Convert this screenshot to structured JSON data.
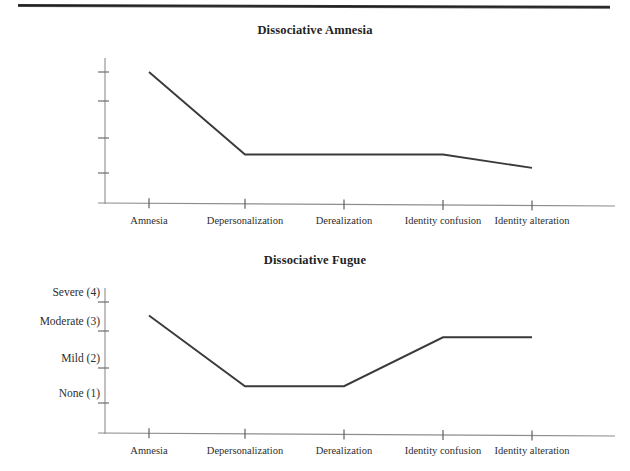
{
  "page": {
    "running_head": "",
    "background_color": "#ffffff",
    "ink_color": "#2b2b2b",
    "rule_color": "#1d1d1d"
  },
  "axis": {
    "y_tick_labels": [
      "Severe (4)",
      "Moderate (3)",
      "Mild (2)",
      "None (1)"
    ],
    "y_tick_values": [
      4,
      3,
      2,
      1
    ],
    "x_tick_labels": [
      "Amnesia",
      "Depersonalization",
      "Derealization",
      "Identity confusion",
      "Identity alteration"
    ]
  },
  "figures": [
    {
      "title": "Dissociative Amnesia"
    },
    {
      "title": "Dissociative Fugue"
    }
  ],
  "chart_data": [
    {
      "type": "line",
      "title": "Dissociative Amnesia",
      "xlabel": "",
      "ylabel": "",
      "categories": [
        "Amnesia",
        "Depersonalization",
        "Derealization",
        "Identity confusion",
        "Identity alteration"
      ],
      "values": [
        4.0,
        1.55,
        1.55,
        1.55,
        1.15
      ],
      "ylim": [
        0.7,
        4.35
      ],
      "ytick_values": [
        4,
        3,
        2,
        1
      ],
      "ytick_labels": [
        "Severe (4)",
        "Moderate (3)",
        "Mild (2)",
        "None (1)"
      ],
      "grid": false,
      "legend": "none",
      "line_color": "#3a3a3a",
      "markers": false
    },
    {
      "type": "line",
      "title": "Dissociative Fugue",
      "xlabel": "",
      "ylabel": "",
      "categories": [
        "Amnesia",
        "Depersonalization",
        "Derealization",
        "Identity confusion",
        "Identity alteration"
      ],
      "values": [
        3.6,
        1.5,
        1.5,
        2.95,
        2.95
      ],
      "ylim": [
        0.7,
        4.35
      ],
      "ytick_values": [
        4,
        3,
        2,
        1
      ],
      "ytick_labels": [
        "Severe (4)",
        "Moderate (3)",
        "Mild (2)",
        "None (1)"
      ],
      "grid": false,
      "legend": "none",
      "line_color": "#3a3a3a",
      "markers": false
    }
  ]
}
